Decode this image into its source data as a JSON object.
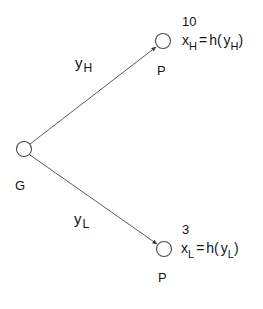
{
  "diagram": {
    "type": "tree",
    "background_color": "#ffffff",
    "stroke_color": "#444444",
    "text_color": "#141414",
    "root": {
      "id": "G",
      "label": "G",
      "shape": "circle",
      "cx": 24,
      "cy": 149,
      "r": 7.5
    },
    "nodes": [
      {
        "id": "P_H",
        "label": "P",
        "shape": "circle",
        "cx": 163,
        "cy": 41,
        "r": 7.5,
        "value": "10",
        "equation": {
          "lhs_base": "x",
          "lhs_sub": "H",
          "relation": "=",
          "rhs_fn": "h(",
          "rhs_base": "y",
          "rhs_sub": "H",
          "rhs_close": ")",
          "full_text": "x H = h( y H )"
        }
      },
      {
        "id": "P_L",
        "label": "P",
        "shape": "circle",
        "cx": 164,
        "cy": 249,
        "r": 7.5,
        "value": "3",
        "equation": {
          "lhs_base": "x",
          "lhs_sub": "L",
          "relation": "=",
          "rhs_fn": "h(",
          "rhs_base": "y",
          "rhs_sub": "L",
          "rhs_close": ")",
          "full_text": "x L = h( y L )"
        }
      }
    ],
    "edges": [
      {
        "id": "edge-high",
        "from": "G",
        "to": "P_H",
        "label_base": "y",
        "label_sub": "H",
        "arrow": true,
        "x1": 30,
        "y1": 144,
        "x2": 156,
        "y2": 47
      },
      {
        "id": "edge-low",
        "from": "G",
        "to": "P_L",
        "label_base": "y",
        "label_sub": "L",
        "arrow": true,
        "x1": 30,
        "y1": 155,
        "x2": 157,
        "y2": 244
      }
    ]
  }
}
